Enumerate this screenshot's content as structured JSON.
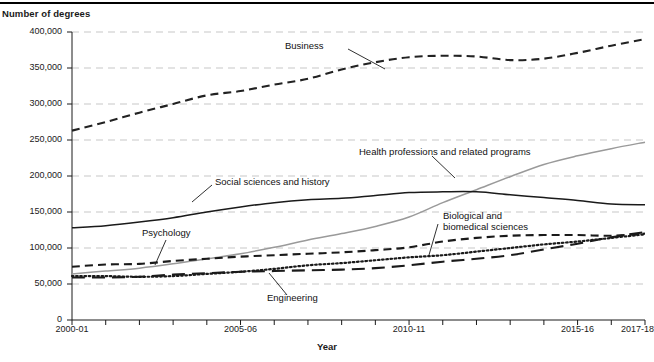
{
  "figure": {
    "y_axis_title": "Number of degrees",
    "x_axis_title": "Year"
  },
  "axis": {
    "y_ticks": [
      "400,000",
      "350,000",
      "300,000",
      "250,000",
      "200,000",
      "150,000",
      "100,000",
      "50,000",
      "0"
    ],
    "x_ticks": [
      "2000-01",
      "2005-06",
      "2010-11",
      "2015-16",
      "2017-18"
    ]
  },
  "series_labels": {
    "business": "Business",
    "health": "Health professions and related programs",
    "social": "Social sciences and history",
    "psychology": "Psychology",
    "biological_line1": "Biological and",
    "biological_line2": "biomedical sciences",
    "engineering": "Engineering"
  },
  "chart_data": {
    "type": "line",
    "title": "",
    "xlabel": "Year",
    "ylabel": "Number of degrees",
    "xlim": [
      "2000-01",
      "2017-18"
    ],
    "ylim": [
      0,
      400000
    ],
    "ytick_step": 50000,
    "grid": true,
    "grid_axis": "y",
    "legend": "inline-annotations",
    "x": [
      "2000-01",
      "2001-02",
      "2002-03",
      "2003-04",
      "2004-05",
      "2005-06",
      "2006-07",
      "2007-08",
      "2008-09",
      "2009-10",
      "2010-11",
      "2011-12",
      "2012-13",
      "2013-14",
      "2014-15",
      "2015-16",
      "2016-17",
      "2017-18"
    ],
    "series": [
      {
        "name": "Business",
        "style": "dashed",
        "color": "#222222",
        "values": [
          263000,
          275000,
          288000,
          300000,
          312000,
          318000,
          327000,
          335000,
          348000,
          358000,
          365000,
          367000,
          366000,
          361000,
          363000,
          371000,
          381000,
          390000
        ]
      },
      {
        "name": "Health professions and related programs",
        "style": "solid",
        "color": "#9a9a9a",
        "values": [
          64000,
          68000,
          72000,
          78000,
          85000,
          92000,
          101000,
          111000,
          120000,
          130000,
          143000,
          163000,
          181000,
          199000,
          216000,
          228000,
          238000,
          247000
        ]
      },
      {
        "name": "Social sciences and history",
        "style": "solid",
        "color": "#1a1a1a",
        "values": [
          128000,
          131000,
          136000,
          142000,
          150000,
          157000,
          163000,
          167000,
          169000,
          173000,
          177000,
          178000,
          178000,
          174000,
          170000,
          166000,
          161000,
          160000
        ]
      },
      {
        "name": "Psychology",
        "style": "dashed",
        "color": "#1a1a1a",
        "values": [
          74000,
          77000,
          78000,
          82000,
          85000,
          88000,
          90000,
          92000,
          94000,
          97000,
          101000,
          109000,
          114000,
          117000,
          118000,
          118000,
          117000,
          120000
        ]
      },
      {
        "name": "Biological and biomedical sciences",
        "style": "dotted",
        "color": "#1a1a1a",
        "values": [
          61000,
          61000,
          60000,
          61000,
          64000,
          67000,
          71000,
          76000,
          79000,
          83000,
          87000,
          90000,
          95000,
          100000,
          105000,
          109000,
          114000,
          119000
        ]
      },
      {
        "name": "Engineering",
        "style": "long-dashed",
        "color": "#1a1a1a",
        "values": [
          59000,
          59000,
          60000,
          63000,
          65000,
          67000,
          68000,
          69000,
          70000,
          72000,
          76000,
          81000,
          85000,
          90000,
          98000,
          106000,
          115000,
          122000
        ]
      }
    ]
  }
}
